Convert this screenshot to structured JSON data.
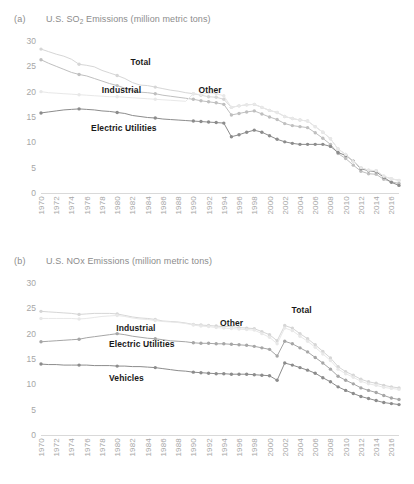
{
  "figure": {
    "panels": [
      {
        "tag": "(a)",
        "title_main": "U.S. SO",
        "title_sub": "2",
        "title_rest": " Emissions (million metric tons)"
      },
      {
        "tag": "(b)",
        "title_main": "U.S. NOx Emissions (million metric tons)",
        "title_sub": "",
        "title_rest": ""
      }
    ]
  },
  "chart_data": [
    {
      "type": "line",
      "title": "U.S. SO2 Emissions (million metric tons)",
      "panel": "(a)",
      "xlabel": "",
      "ylabel": "million metric tons",
      "ylim": [
        0,
        30
      ],
      "yticks": [
        0,
        5,
        10,
        15,
        20,
        25,
        30
      ],
      "grid": false,
      "legend": "inline-labels",
      "x": [
        1970,
        1971,
        1972,
        1973,
        1974,
        1975,
        1976,
        1977,
        1978,
        1979,
        1980,
        1981,
        1982,
        1983,
        1984,
        1985,
        1986,
        1987,
        1988,
        1989,
        1990,
        1991,
        1992,
        1993,
        1994,
        1995,
        1996,
        1997,
        1998,
        1999,
        2000,
        2001,
        2002,
        2003,
        2004,
        2005,
        2006,
        2007,
        2008,
        2009,
        2010,
        2011,
        2012,
        2013,
        2014,
        2015,
        2016,
        2017
      ],
      "xtick_labels": [
        "1970",
        "1972",
        "1974",
        "1976",
        "1978",
        "1980",
        "1982",
        "1984",
        "1986",
        "1988",
        "1990",
        "1992",
        "1994",
        "1996",
        "1998",
        "2000",
        "2002",
        "2004",
        "2006",
        "2008",
        "2010",
        "2012",
        "2014",
        "2016"
      ],
      "series": [
        {
          "name": "Total",
          "color": "#d6d6d6",
          "values": [
            28.4,
            27.9,
            27.4,
            27.0,
            26.4,
            25.4,
            25.2,
            24.9,
            24.2,
            23.7,
            23.2,
            22.6,
            21.8,
            21.3,
            21.2,
            20.9,
            20.6,
            20.3,
            20.1,
            19.8,
            19.6,
            19.3,
            19.0,
            18.9,
            18.5,
            16.9,
            17.2,
            17.4,
            17.5,
            16.9,
            16.3,
            15.9,
            15.1,
            14.7,
            14.4,
            14.2,
            13.1,
            12.0,
            10.7,
            8.7,
            7.6,
            6.2,
            5.0,
            4.5,
            4.4,
            3.3,
            2.8,
            2.5
          ]
        },
        {
          "name": "Industrial",
          "color": "#bfbfbf",
          "values": [
            26.3,
            25.6,
            25.0,
            24.4,
            23.8,
            23.4,
            23.1,
            22.6,
            22.1,
            21.6,
            21.2,
            20.7,
            20.2,
            19.9,
            19.8,
            19.6,
            19.3,
            19.1,
            18.9,
            18.7,
            18.5,
            18.2,
            18.0,
            17.8,
            17.5,
            15.4,
            15.7,
            16.0,
            16.2,
            15.6,
            15.0,
            14.5,
            13.7,
            13.3,
            13.1,
            12.9,
            11.9,
            10.8,
            9.6,
            7.8,
            6.8,
            5.5,
            4.3,
            3.8,
            3.7,
            2.7,
            2.2,
            1.9
          ]
        },
        {
          "name": "Electric Utilities",
          "color": "#8c8c8c",
          "values": [
            15.8,
            16.0,
            16.2,
            16.4,
            16.5,
            16.6,
            16.5,
            16.4,
            16.2,
            16.1,
            15.9,
            15.7,
            15.3,
            15.1,
            14.9,
            14.8,
            14.6,
            14.5,
            14.4,
            14.3,
            14.2,
            14.1,
            14.0,
            13.9,
            13.8,
            11.1,
            11.5,
            12.0,
            12.4,
            12.0,
            11.3,
            10.6,
            10.1,
            9.8,
            9.6,
            9.6,
            9.6,
            9.6,
            9.2,
            8.0,
            7.4,
            6.3,
            4.8,
            4.4,
            4.2,
            3.1,
            2.1,
            1.5
          ]
        },
        {
          "name": "Other",
          "color": "#e8e8e8",
          "values": [
            20.0,
            19.8,
            19.7,
            19.6,
            19.5,
            19.4,
            19.3,
            19.2,
            19.1,
            19.0,
            19.0,
            18.9,
            18.8,
            18.7,
            18.6,
            18.5,
            18.4,
            18.3,
            18.2,
            18.1,
            19.6,
            19.4,
            19.8,
            19.6,
            19.2,
            16.9,
            17.2,
            17.4,
            17.5,
            16.9,
            16.3,
            15.9,
            15.1,
            14.7,
            14.4,
            14.2,
            13.1,
            12.0,
            10.7,
            8.7,
            7.6,
            6.2,
            5.0,
            4.5,
            4.4,
            3.3,
            2.8,
            2.5
          ]
        }
      ],
      "annotations": [
        {
          "text": "Total",
          "x_frac": 0.25,
          "y_value": 25.8
        },
        {
          "text": "Industrial",
          "x_frac": 0.17,
          "y_value": 20.4
        },
        {
          "text": "Other",
          "x_frac": 0.44,
          "y_value": 20.3
        },
        {
          "text": "Electric Utilities",
          "x_frac": 0.14,
          "y_value": 12.8
        }
      ]
    },
    {
      "type": "line",
      "title": "U.S. NOx Emissions (million metric tons)",
      "panel": "(b)",
      "xlabel": "",
      "ylabel": "million metric tons",
      "ylim": [
        0,
        30
      ],
      "yticks": [
        0,
        5,
        10,
        15,
        20,
        25,
        30
      ],
      "grid": false,
      "legend": "inline-labels",
      "x": [
        1970,
        1971,
        1972,
        1973,
        1974,
        1975,
        1976,
        1977,
        1978,
        1979,
        1980,
        1981,
        1982,
        1983,
        1984,
        1985,
        1986,
        1987,
        1988,
        1989,
        1990,
        1991,
        1992,
        1993,
        1994,
        1995,
        1996,
        1997,
        1998,
        1999,
        2000,
        2001,
        2002,
        2003,
        2004,
        2005,
        2006,
        2007,
        2008,
        2009,
        2010,
        2011,
        2012,
        2013,
        2014,
        2015,
        2016,
        2017
      ],
      "xtick_labels": [
        "1970",
        "1972",
        "1974",
        "1976",
        "1978",
        "1980",
        "1982",
        "1984",
        "1986",
        "1988",
        "1990",
        "1992",
        "1994",
        "1996",
        "1998",
        "2000",
        "2002",
        "2004",
        "2006",
        "2008",
        "2010",
        "2012",
        "2014",
        "2016"
      ],
      "series": [
        {
          "name": "Total",
          "color": "#d6d6d6",
          "values": [
            24.4,
            24.3,
            24.2,
            24.1,
            24.0,
            23.8,
            23.9,
            24.0,
            24.0,
            24.0,
            23.9,
            23.6,
            23.3,
            23.1,
            23.0,
            22.8,
            22.5,
            22.4,
            22.3,
            22.1,
            21.8,
            21.7,
            21.6,
            21.5,
            21.4,
            21.4,
            21.2,
            21.1,
            21.0,
            20.4,
            19.8,
            18.6,
            21.6,
            21.1,
            20.0,
            19.0,
            17.8,
            16.5,
            15.2,
            13.5,
            12.5,
            11.8,
            11.0,
            10.5,
            10.2,
            9.8,
            9.5,
            9.3
          ]
        },
        {
          "name": "Other",
          "color": "#e8e8e8",
          "values": [
            23.0,
            23.0,
            23.0,
            23.0,
            23.0,
            22.9,
            23.0,
            23.2,
            23.4,
            23.5,
            23.6,
            23.4,
            23.1,
            22.9,
            22.8,
            22.6,
            22.4,
            22.3,
            22.2,
            22.0,
            21.7,
            21.5,
            21.4,
            21.2,
            21.1,
            21.0,
            20.9,
            20.8,
            20.7,
            20.0,
            19.3,
            18.0,
            21.1,
            20.6,
            19.5,
            18.5,
            17.3,
            16.0,
            14.7,
            13.0,
            12.1,
            11.4,
            10.6,
            10.1,
            9.8,
            9.4,
            9.2,
            9.0
          ]
        },
        {
          "name": "Industrial",
          "color": "#a6a6a6",
          "values": [
            18.4,
            18.5,
            18.6,
            18.7,
            18.8,
            18.9,
            19.2,
            19.4,
            19.6,
            19.8,
            20.0,
            19.8,
            19.5,
            19.3,
            19.1,
            19.0,
            18.8,
            18.6,
            18.5,
            18.4,
            18.2,
            18.1,
            18.1,
            18.0,
            18.0,
            17.9,
            17.8,
            17.7,
            17.5,
            17.2,
            16.9,
            15.6,
            18.5,
            18.0,
            17.2,
            16.4,
            15.3,
            14.2,
            13.0,
            11.6,
            10.8,
            10.1,
            9.3,
            8.8,
            8.4,
            7.8,
            7.3,
            7.0
          ]
        },
        {
          "name": "Electric Utilities",
          "color": "#8c8c8c",
          "values": [
            14.0,
            13.9,
            13.9,
            13.8,
            13.8,
            13.8,
            13.8,
            13.7,
            13.7,
            13.7,
            13.6,
            13.6,
            13.5,
            13.5,
            13.4,
            13.3,
            13.1,
            12.9,
            12.7,
            12.6,
            12.4,
            12.3,
            12.2,
            12.1,
            12.1,
            12.0,
            12.0,
            12.0,
            11.9,
            11.8,
            11.7,
            10.8,
            14.2,
            13.8,
            13.3,
            12.8,
            12.2,
            11.3,
            10.5,
            9.5,
            8.8,
            8.2,
            7.6,
            7.2,
            6.8,
            6.4,
            6.2,
            6.0
          ]
        }
      ],
      "annotations": [
        {
          "text": "Total",
          "x_frac": 0.7,
          "y_value": 24.6
        },
        {
          "text": "Other",
          "x_frac": 0.5,
          "y_value": 22.2
        },
        {
          "text": "Industrial",
          "x_frac": 0.21,
          "y_value": 21.2
        },
        {
          "text": "Electric Utilities",
          "x_frac": 0.19,
          "y_value": 18.0
        },
        {
          "text": "Vehicles",
          "x_frac": 0.19,
          "y_value": 11.2
        }
      ]
    }
  ]
}
